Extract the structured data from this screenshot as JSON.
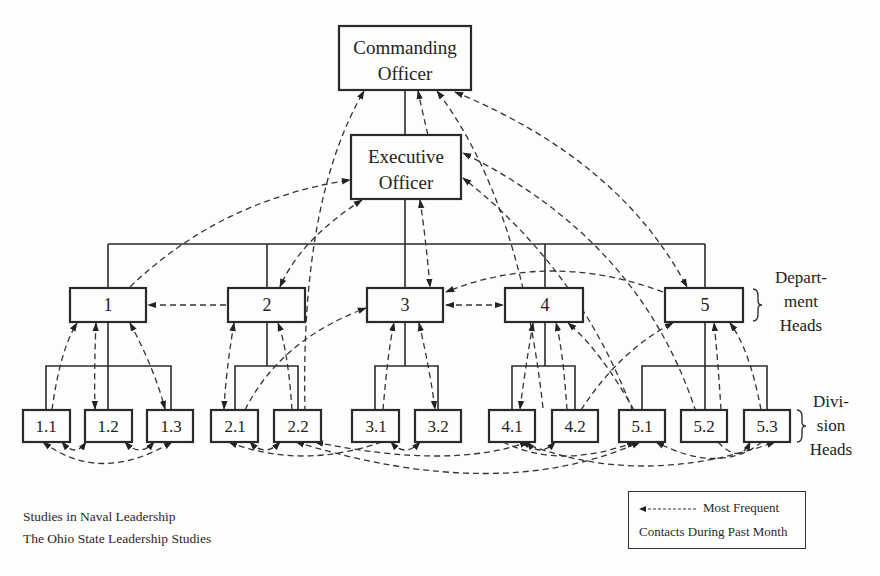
{
  "diagram": {
    "type": "organization-chart",
    "top": {
      "commanding_officer": [
        "Commanding",
        "Officer"
      ],
      "executive_officer": [
        "Executive",
        "Officer"
      ]
    },
    "departments": [
      "1",
      "2",
      "3",
      "4",
      "5"
    ],
    "divisions": [
      "1.1",
      "1.2",
      "1.3",
      "2.1",
      "2.2",
      "3.1",
      "3.2",
      "4.1",
      "4.2",
      "5.1",
      "5.2",
      "5.3"
    ],
    "side_labels": {
      "department_heads": [
        "Depart-",
        "ment",
        "Heads"
      ],
      "division_heads": [
        "Divi-",
        "sion",
        "Heads"
      ]
    }
  },
  "footer": {
    "line1": "Studies in Naval Leadership",
    "line2": "The Ohio State Leadership Studies"
  },
  "legend": {
    "line1": "Most Frequent",
    "line2": "Contacts During Past Month",
    "symbol": "dashed-arrow"
  }
}
